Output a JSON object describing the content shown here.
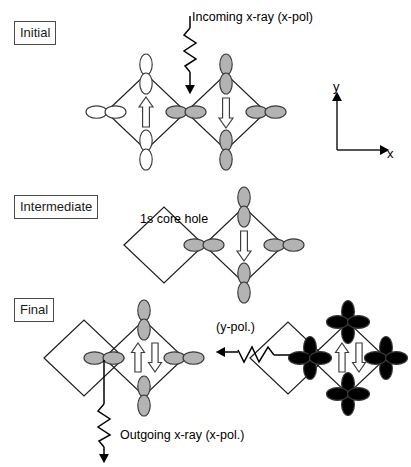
{
  "figure": {
    "width": 411,
    "height": 467,
    "background": "#ffffff"
  },
  "colors": {
    "line": "#000000",
    "orbital_stroke": "#3a3a3a",
    "orbital_filled": "#b3b3b3",
    "orbital_empty": "#ffffff",
    "label_border": "#4a4a4a",
    "text": "#000000"
  },
  "stages": [
    {
      "id": "initial",
      "label": "Initial"
    },
    {
      "id": "intermediate",
      "label": "Intermediate"
    },
    {
      "id": "final",
      "label": "Final"
    }
  ],
  "annotations": {
    "incoming_xray": "Incoming x-ray (x-pol)",
    "core_hole": "1s core hole",
    "outgoing_xray": "Outgoing x-ray (x-pol.)",
    "y_polarization": "(y-pol.)"
  },
  "axes": {
    "x_label": "x",
    "y_label": "y"
  },
  "panels": {
    "initial": {
      "left_cluster_fill": "empty",
      "right_cluster_fill": "filled",
      "left_spin": "up",
      "right_spin": "down",
      "orbital_type": "p",
      "center_orbital_fill": "filled"
    },
    "intermediate": {
      "left_cluster_fill": "none",
      "right_cluster_fill": "filled",
      "right_spin": "down",
      "orbital_type": "p"
    },
    "final_left": {
      "left_cluster_fill": "none",
      "right_cluster_fill": "filled",
      "right_spin": "paired",
      "orbital_type": "p"
    },
    "final_right": {
      "left_cluster_fill": "none",
      "right_cluster_fill": "filled",
      "right_spin": "paired",
      "orbital_type": "d"
    }
  }
}
